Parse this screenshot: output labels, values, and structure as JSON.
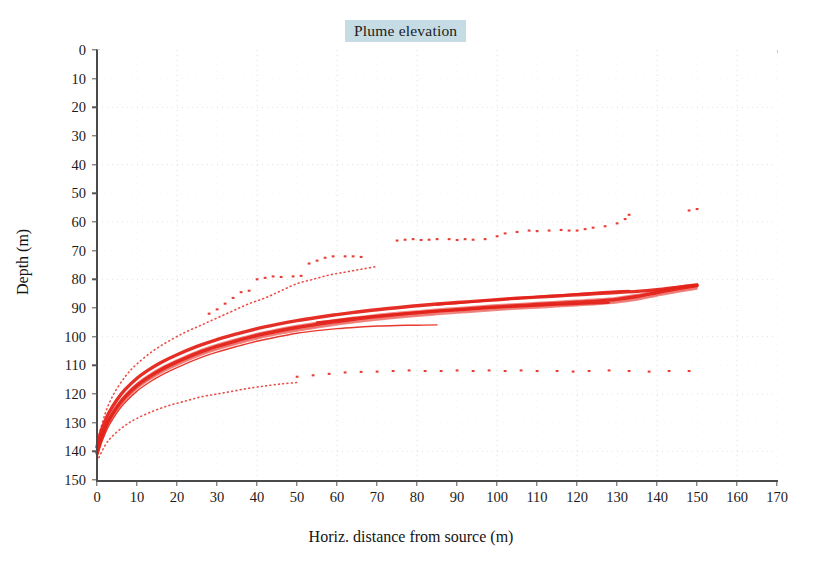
{
  "chart_data": {
    "type": "scatter",
    "title": "Plume elevation",
    "xlabel": "Horiz. distance from source (m)",
    "ylabel": "Depth (m)",
    "xlim": [
      0,
      170
    ],
    "ylim": [
      150,
      0
    ],
    "y_inverted": true,
    "xticks": [
      0,
      10,
      20,
      30,
      40,
      50,
      60,
      70,
      80,
      90,
      100,
      110,
      120,
      130,
      140,
      150,
      160,
      170
    ],
    "yticks": [
      0,
      10,
      20,
      30,
      40,
      50,
      60,
      70,
      80,
      90,
      100,
      110,
      120,
      130,
      140,
      150
    ],
    "grid": true,
    "grid_style": "dotted",
    "grid_color": "#d8dee2",
    "series_color": "#e3231a",
    "legend": "none",
    "series": [
      {
        "name": "plume-centreline-band-upper",
        "style": "solid-thick",
        "points": [
          [
            0,
            138.5
          ],
          [
            1,
            133.0
          ],
          [
            2,
            129.5
          ],
          [
            3,
            126.5
          ],
          [
            5,
            122.0
          ],
          [
            7,
            118.5
          ],
          [
            10,
            114.5
          ],
          [
            13,
            111.5
          ],
          [
            16,
            109.0
          ],
          [
            20,
            106.3
          ],
          [
            25,
            103.4
          ],
          [
            30,
            101.0
          ],
          [
            35,
            99.0
          ],
          [
            40,
            97.2
          ],
          [
            45,
            95.7
          ],
          [
            50,
            94.4
          ],
          [
            55,
            93.3
          ],
          [
            60,
            92.3
          ],
          [
            65,
            91.4
          ],
          [
            70,
            90.6
          ],
          [
            75,
            89.9
          ],
          [
            80,
            89.2
          ],
          [
            85,
            88.6
          ],
          [
            90,
            88.1
          ],
          [
            95,
            87.6
          ],
          [
            100,
            87.1
          ],
          [
            105,
            86.6
          ],
          [
            110,
            86.2
          ],
          [
            115,
            85.8
          ],
          [
            120,
            85.4
          ],
          [
            125,
            85.0
          ],
          [
            130,
            84.6
          ],
          [
            135,
            84.2
          ],
          [
            140,
            83.6
          ],
          [
            145,
            82.8
          ],
          [
            150,
            82.0
          ]
        ]
      },
      {
        "name": "plume-centreline-band-core",
        "style": "solid-thick",
        "points": [
          [
            0,
            140.5
          ],
          [
            1,
            135.5
          ],
          [
            2,
            132.0
          ],
          [
            3,
            129.0
          ],
          [
            5,
            124.5
          ],
          [
            7,
            121.0
          ],
          [
            10,
            117.0
          ],
          [
            13,
            114.0
          ],
          [
            16,
            111.5
          ],
          [
            20,
            108.8
          ],
          [
            25,
            105.8
          ],
          [
            30,
            103.4
          ],
          [
            35,
            101.4
          ],
          [
            40,
            99.6
          ],
          [
            45,
            98.1
          ],
          [
            50,
            96.8
          ],
          [
            55,
            95.7
          ],
          [
            60,
            94.7
          ],
          [
            65,
            93.8
          ],
          [
            70,
            93.0
          ],
          [
            75,
            92.3
          ],
          [
            80,
            91.7
          ],
          [
            85,
            91.1
          ],
          [
            90,
            90.6
          ],
          [
            95,
            90.1
          ],
          [
            100,
            89.6
          ],
          [
            105,
            89.2
          ],
          [
            110,
            88.8
          ],
          [
            115,
            88.4
          ],
          [
            120,
            88.0
          ],
          [
            125,
            87.6
          ],
          [
            130,
            87.0
          ],
          [
            135,
            86.0
          ],
          [
            140,
            84.6
          ],
          [
            145,
            83.3
          ],
          [
            150,
            82.2
          ]
        ]
      },
      {
        "name": "plume-centreline-band-lower",
        "style": "solid-thin",
        "points": [
          [
            0,
            142.0
          ],
          [
            1,
            137.5
          ],
          [
            2,
            134.0
          ],
          [
            3,
            131.0
          ],
          [
            5,
            126.5
          ],
          [
            7,
            123.0
          ],
          [
            10,
            119.0
          ],
          [
            13,
            116.0
          ],
          [
            16,
            113.5
          ],
          [
            20,
            110.8
          ],
          [
            25,
            107.8
          ],
          [
            30,
            105.4
          ],
          [
            35,
            103.4
          ],
          [
            40,
            101.6
          ],
          [
            45,
            100.1
          ],
          [
            50,
            98.8
          ],
          [
            55,
            97.9
          ],
          [
            60,
            97.2
          ],
          [
            65,
            96.7
          ],
          [
            70,
            96.3
          ],
          [
            75,
            96.1
          ],
          [
            80,
            96.0
          ],
          [
            85,
            95.9
          ]
        ]
      },
      {
        "name": "plume-secondary-branch",
        "style": "solid-medium",
        "points": [
          [
            55,
            95.0
          ],
          [
            60,
            94.2
          ],
          [
            65,
            93.4
          ],
          [
            70,
            92.7
          ],
          [
            75,
            92.1
          ],
          [
            80,
            91.5
          ],
          [
            85,
            91.0
          ],
          [
            90,
            90.6
          ],
          [
            95,
            90.2
          ],
          [
            100,
            89.8
          ],
          [
            105,
            89.5
          ],
          [
            110,
            89.2
          ],
          [
            115,
            88.9
          ],
          [
            120,
            88.6
          ],
          [
            125,
            88.3
          ],
          [
            128,
            88.2
          ]
        ]
      },
      {
        "name": "plume-upper-branch",
        "style": "solid-medium",
        "points": [
          [
            85,
            88.9
          ],
          [
            90,
            88.3
          ],
          [
            95,
            87.7
          ],
          [
            100,
            87.1
          ],
          [
            105,
            86.6
          ],
          [
            110,
            86.1
          ],
          [
            115,
            85.6
          ],
          [
            120,
            85.1
          ],
          [
            125,
            84.6
          ],
          [
            130,
            84.2
          ],
          [
            133,
            84.0
          ]
        ]
      },
      {
        "name": "plume-envelope-upper-dotted",
        "style": "dotted",
        "points": [
          [
            0,
            137.0
          ],
          [
            2,
            127.0
          ],
          [
            4,
            120.5
          ],
          [
            7,
            114.0
          ],
          [
            10,
            109.5
          ],
          [
            14,
            105.0
          ],
          [
            18,
            101.5
          ],
          [
            22,
            98.5
          ],
          [
            26,
            96.0
          ],
          [
            30,
            93.5
          ],
          [
            34,
            91.0
          ],
          [
            38,
            88.5
          ],
          [
            42,
            86.5
          ],
          [
            46,
            84.0
          ],
          [
            50,
            81.5
          ],
          [
            54,
            80.0
          ],
          [
            58,
            78.5
          ],
          [
            62,
            77.5
          ],
          [
            66,
            76.5
          ],
          [
            70,
            75.5
          ]
        ]
      },
      {
        "name": "plume-envelope-lower-dotted",
        "style": "dotted",
        "points": [
          [
            0,
            143.5
          ],
          [
            2,
            138.0
          ],
          [
            4,
            134.5
          ],
          [
            7,
            131.0
          ],
          [
            10,
            128.5
          ],
          [
            14,
            126.0
          ],
          [
            18,
            124.0
          ],
          [
            22,
            122.5
          ],
          [
            26,
            121.0
          ],
          [
            30,
            120.0
          ],
          [
            34,
            119.0
          ],
          [
            38,
            118.0
          ],
          [
            42,
            117.2
          ],
          [
            46,
            116.5
          ],
          [
            50,
            116.0
          ]
        ]
      }
    ],
    "scatter_clusters": [
      {
        "name": "upper-scatter-band",
        "points": [
          [
            40,
            80.0
          ],
          [
            42,
            79.5
          ],
          [
            44,
            79.0
          ],
          [
            46,
            79.2
          ],
          [
            49,
            79.0
          ],
          [
            51,
            78.8
          ],
          [
            36,
            84.5
          ],
          [
            38,
            84.0
          ],
          [
            34,
            86.5
          ],
          [
            32,
            88.5
          ],
          [
            30,
            90.5
          ],
          [
            28,
            92.0
          ],
          [
            53,
            74.5
          ],
          [
            55,
            73.5
          ],
          [
            57,
            72.5
          ],
          [
            59,
            72.0
          ],
          [
            62,
            72.0
          ],
          [
            64,
            72.0
          ],
          [
            66,
            72.2
          ]
        ]
      },
      {
        "name": "mid-scatter-band",
        "points": [
          [
            75,
            66.5
          ],
          [
            77,
            66.2
          ],
          [
            79,
            66.0
          ],
          [
            81,
            66.3
          ],
          [
            83,
            66.2
          ],
          [
            85,
            66.0
          ],
          [
            88,
            66.0
          ],
          [
            90,
            66.3
          ],
          [
            92,
            66.0
          ],
          [
            94,
            66.2
          ],
          [
            97,
            66.0
          ],
          [
            100,
            65.0
          ],
          [
            102,
            64.0
          ],
          [
            105,
            63.5
          ],
          [
            108,
            63.0
          ],
          [
            110,
            63.2
          ],
          [
            113,
            63.0
          ],
          [
            116,
            62.8
          ],
          [
            118,
            63.0
          ],
          [
            120,
            63.0
          ],
          [
            122,
            62.5
          ],
          [
            124,
            62.0
          ],
          [
            127,
            61.5
          ],
          [
            130,
            60.5
          ],
          [
            132,
            59.0
          ],
          [
            133,
            57.5
          ],
          [
            148,
            56.0
          ],
          [
            150,
            55.5
          ]
        ]
      },
      {
        "name": "lower-scatter-band",
        "points": [
          [
            50,
            114.0
          ],
          [
            54,
            113.5
          ],
          [
            58,
            113.0
          ],
          [
            62,
            112.5
          ],
          [
            66,
            112.3
          ],
          [
            70,
            112.2
          ],
          [
            74,
            112.0
          ],
          [
            78,
            111.8
          ],
          [
            82,
            112.0
          ],
          [
            86,
            112.0
          ],
          [
            90,
            111.8
          ],
          [
            94,
            112.0
          ],
          [
            98,
            111.8
          ],
          [
            102,
            112.0
          ],
          [
            106,
            111.8
          ],
          [
            110,
            112.0
          ],
          [
            115,
            112.0
          ],
          [
            119,
            112.2
          ],
          [
            123,
            112.0
          ],
          [
            128,
            111.8
          ],
          [
            133,
            112.0
          ],
          [
            138,
            112.2
          ],
          [
            143,
            112.0
          ],
          [
            148,
            112.0
          ]
        ]
      }
    ]
  },
  "title": {
    "text": "Plume elevation"
  },
  "axes": {
    "x_title": "Horiz. distance from source (m)",
    "y_title": "Depth (m)"
  }
}
